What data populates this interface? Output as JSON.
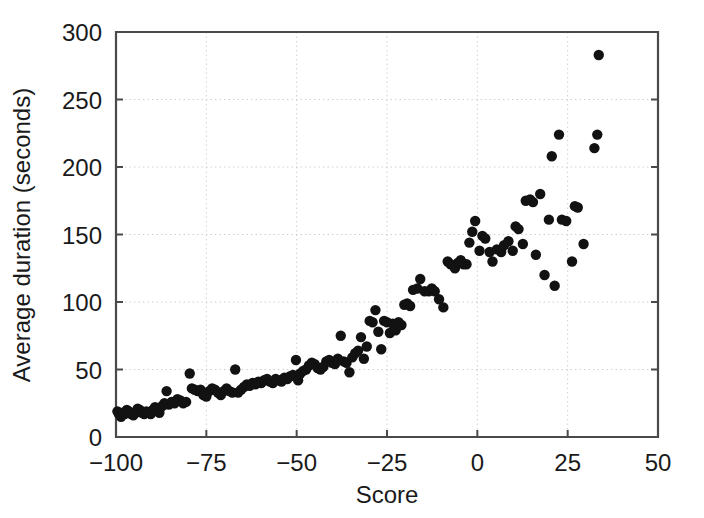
{
  "chart_data": {
    "type": "scatter",
    "title": "",
    "xlabel": "Score",
    "ylabel": "Average duration (seconds)",
    "xlim": [
      -100,
      50
    ],
    "ylim": [
      0,
      300
    ],
    "xticks": [
      -100,
      -75,
      -50,
      -25,
      0,
      25,
      50
    ],
    "xtick_labels": [
      "−100",
      "−75",
      "−50",
      "−25",
      "0",
      "25",
      "50"
    ],
    "yticks": [
      0,
      50,
      100,
      150,
      200,
      250,
      300
    ],
    "ytick_labels": [
      "0",
      "50",
      "100",
      "150",
      "200",
      "250",
      "300"
    ],
    "grid": true,
    "grid_style": "dotted",
    "legend": "none",
    "marker": "filled-circle",
    "marker_color": "#121212",
    "marker_size": 5.2,
    "n_points": 152,
    "points": [
      [
        -99.6,
        19
      ],
      [
        -99.2,
        17
      ],
      [
        -98.6,
        15
      ],
      [
        -98.1,
        18
      ],
      [
        -97.6,
        17
      ],
      [
        -97.0,
        20
      ],
      [
        -96.4,
        19
      ],
      [
        -95.8,
        17
      ],
      [
        -95.2,
        16
      ],
      [
        -94.6,
        18
      ],
      [
        -94.0,
        21
      ],
      [
        -93.4,
        20
      ],
      [
        -92.8,
        18
      ],
      [
        -92.2,
        17
      ],
      [
        -91.6,
        19
      ],
      [
        -91.0,
        18
      ],
      [
        -90.4,
        17
      ],
      [
        -89.8,
        20
      ],
      [
        -89.2,
        22
      ],
      [
        -88.6,
        21
      ],
      [
        -88.0,
        18
      ],
      [
        -87.2,
        23
      ],
      [
        -86.6,
        25
      ],
      [
        -86.0,
        34
      ],
      [
        -85.4,
        24
      ],
      [
        -84.6,
        26
      ],
      [
        -83.8,
        25
      ],
      [
        -83.0,
        28
      ],
      [
        -82.2,
        27
      ],
      [
        -81.4,
        25
      ],
      [
        -80.6,
        26
      ],
      [
        -79.6,
        47
      ],
      [
        -79.0,
        36
      ],
      [
        -78.2,
        35
      ],
      [
        -77.4,
        34
      ],
      [
        -76.6,
        35
      ],
      [
        -75.8,
        31
      ],
      [
        -75.0,
        30
      ],
      [
        -74.2,
        34
      ],
      [
        -73.4,
        36
      ],
      [
        -72.6,
        35
      ],
      [
        -71.8,
        33
      ],
      [
        -71.0,
        31
      ],
      [
        -70.2,
        34
      ],
      [
        -69.4,
        36
      ],
      [
        -68.6,
        34
      ],
      [
        -67.8,
        33
      ],
      [
        -67.0,
        50
      ],
      [
        -66.2,
        33
      ],
      [
        -65.4,
        35
      ],
      [
        -64.6,
        37
      ],
      [
        -63.8,
        39
      ],
      [
        -63.0,
        38
      ],
      [
        -62.2,
        40
      ],
      [
        -61.4,
        39
      ],
      [
        -60.6,
        41
      ],
      [
        -59.8,
        40
      ],
      [
        -59.0,
        42
      ],
      [
        -58.2,
        43
      ],
      [
        -57.4,
        41
      ],
      [
        -56.6,
        40
      ],
      [
        -55.8,
        43
      ],
      [
        -55.0,
        42
      ],
      [
        -54.2,
        41
      ],
      [
        -53.4,
        44
      ],
      [
        -52.6,
        43
      ],
      [
        -51.8,
        45
      ],
      [
        -51.0,
        46
      ],
      [
        -50.2,
        57
      ],
      [
        -49.6,
        42
      ],
      [
        -49.0,
        47
      ],
      [
        -48.2,
        49
      ],
      [
        -47.4,
        50
      ],
      [
        -46.6,
        53
      ],
      [
        -45.8,
        55
      ],
      [
        -45.0,
        54
      ],
      [
        -44.2,
        51
      ],
      [
        -43.4,
        50
      ],
      [
        -42.6,
        52
      ],
      [
        -41.8,
        56
      ],
      [
        -41.0,
        57
      ],
      [
        -40.2,
        55
      ],
      [
        -39.4,
        54
      ],
      [
        -38.6,
        58
      ],
      [
        -37.8,
        75
      ],
      [
        -37.0,
        56
      ],
      [
        -36.2,
        55
      ],
      [
        -35.4,
        48
      ],
      [
        -34.6,
        59
      ],
      [
        -33.8,
        62
      ],
      [
        -33.0,
        64
      ],
      [
        -32.2,
        74
      ],
      [
        -31.4,
        58
      ],
      [
        -30.6,
        67
      ],
      [
        -29.8,
        86
      ],
      [
        -29.0,
        85
      ],
      [
        -28.2,
        94
      ],
      [
        -27.4,
        78
      ],
      [
        -26.6,
        65
      ],
      [
        -25.8,
        86
      ],
      [
        -25.0,
        85
      ],
      [
        -24.2,
        77
      ],
      [
        -23.4,
        84
      ],
      [
        -22.6,
        79
      ],
      [
        -21.8,
        85
      ],
      [
        -21.0,
        83
      ],
      [
        -20.2,
        98
      ],
      [
        -19.4,
        99
      ],
      [
        -18.6,
        97
      ],
      [
        -17.8,
        109
      ],
      [
        -16.6,
        110
      ],
      [
        -15.8,
        117
      ],
      [
        -14.6,
        108
      ],
      [
        -13.4,
        108
      ],
      [
        -12.6,
        110
      ],
      [
        -11.8,
        108
      ],
      [
        -10.6,
        102
      ],
      [
        -9.4,
        96
      ],
      [
        -8.2,
        130
      ],
      [
        -7.4,
        128
      ],
      [
        -6.2,
        125
      ],
      [
        -5.4,
        129
      ],
      [
        -4.6,
        131
      ],
      [
        -3.8,
        128
      ],
      [
        -3.0,
        128
      ],
      [
        -2.2,
        144
      ],
      [
        -1.4,
        152
      ],
      [
        -0.6,
        160
      ],
      [
        0.6,
        138
      ],
      [
        1.4,
        149
      ],
      [
        2.2,
        147
      ],
      [
        3.4,
        137
      ],
      [
        4.2,
        130
      ],
      [
        5.4,
        139
      ],
      [
        6.6,
        137
      ],
      [
        7.4,
        142
      ],
      [
        8.6,
        145
      ],
      [
        9.8,
        138
      ],
      [
        10.6,
        156
      ],
      [
        11.4,
        154
      ],
      [
        12.6,
        143
      ],
      [
        13.4,
        175
      ],
      [
        14.6,
        176
      ],
      [
        15.4,
        174
      ],
      [
        16.2,
        135
      ],
      [
        17.4,
        180
      ],
      [
        18.6,
        120
      ],
      [
        19.8,
        161
      ],
      [
        20.6,
        208
      ],
      [
        21.4,
        112
      ],
      [
        22.6,
        224
      ],
      [
        23.4,
        161
      ],
      [
        24.6,
        160
      ],
      [
        26.2,
        130
      ],
      [
        27.0,
        171
      ],
      [
        27.8,
        170
      ],
      [
        29.4,
        143
      ],
      [
        32.4,
        214
      ],
      [
        33.2,
        224
      ],
      [
        33.6,
        283
      ]
    ]
  },
  "axis": {
    "x_axis_name": "x-axis",
    "y_axis_name": "y-axis"
  },
  "icons": {
    "plot_frame": "plot-frame"
  }
}
